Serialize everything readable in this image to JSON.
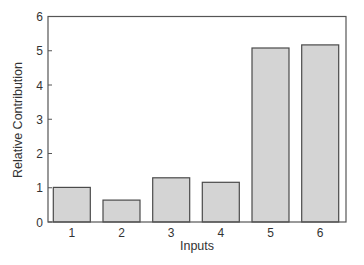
{
  "chart_data": {
    "type": "bar",
    "title": "",
    "xlabel": "Inputs",
    "ylabel": "Relative Contribution",
    "categories": [
      "1",
      "2",
      "3",
      "4",
      "5",
      "6"
    ],
    "values": [
      1.01,
      0.64,
      1.29,
      1.16,
      5.08,
      5.17
    ],
    "ylim": [
      0,
      6
    ],
    "yticks": [
      "0",
      "1",
      "2",
      "3",
      "4",
      "5",
      "6"
    ],
    "grid": false,
    "legend": null,
    "colors": {
      "bar_fill": "#d4d4d4",
      "bar_edge": "#4a4a4a",
      "axis": "#555555"
    }
  }
}
